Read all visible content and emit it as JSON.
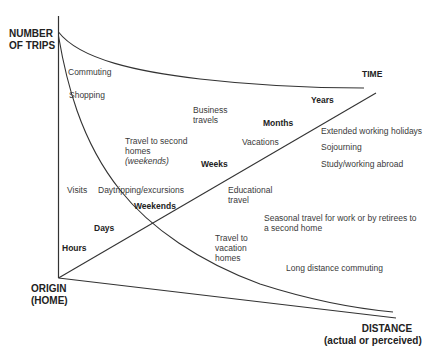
{
  "axes": {
    "y_label_line1": "NUMBER",
    "y_label_line2": "OF TRIPS",
    "origin_line1": "ORIGIN",
    "origin_line2": "(HOME)",
    "x_label_line1": "DISTANCE",
    "x_label_line2": "(actual or perceived)",
    "time_label": "TIME"
  },
  "time_markers": {
    "hours": "Hours",
    "days": "Days",
    "weekends": "Weekends",
    "weeks": "Weeks",
    "months": "Months",
    "years": "Years"
  },
  "activities": {
    "commuting": "Commuting",
    "shopping": "Shopping",
    "business_l1": "Business",
    "business_l2": "travels",
    "second_homes_l1": "Travel to second",
    "second_homes_l2": "homes",
    "second_homes_l3": "(weekends)",
    "vacations": "Vacations",
    "extended": "Extended working holidays",
    "sojourning": "Sojourning",
    "study_abroad": "Study/working abroad",
    "visits": "Visits",
    "daytripping": "Daytripping/excursions",
    "educational_l1": "Educational",
    "educational_l2": "travel",
    "seasonal_l1": "Seasonal travel for work or by retirees to",
    "seasonal_l2": "a second home",
    "vacation_homes_l1": "Travel to",
    "vacation_homes_l2": "vacation",
    "vacation_homes_l3": "homes",
    "long_distance": "Long distance commuting"
  },
  "colors": {
    "line": "#333333",
    "text": "#3a3a3a",
    "background": "#ffffff"
  }
}
